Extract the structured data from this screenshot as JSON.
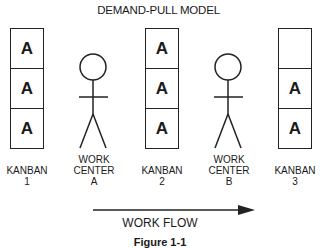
{
  "title": "DEMAND-PULL MODEL",
  "kanbans": [
    {
      "label_line1": "KANBAN",
      "label_line2": "1",
      "cells": [
        "A",
        "A",
        "A"
      ]
    },
    {
      "label_line1": "KANBAN",
      "label_line2": "2",
      "cells": [
        "A",
        "A",
        "A"
      ]
    },
    {
      "label_line1": "KANBAN",
      "label_line2": "3",
      "cells": [
        "",
        "A",
        "A"
      ]
    }
  ],
  "work_centers": [
    {
      "label_line1": "WORK",
      "label_line2": "CENTER",
      "label_line3": "A",
      "icon": "stick-figure-icon"
    },
    {
      "label_line1": "WORK",
      "label_line2": "CENTER",
      "label_line3": "B",
      "icon": "stick-figure-icon"
    }
  ],
  "flow": {
    "label": "WORK FLOW",
    "direction": "right-arrow-icon"
  },
  "caption": "Figure 1-1"
}
